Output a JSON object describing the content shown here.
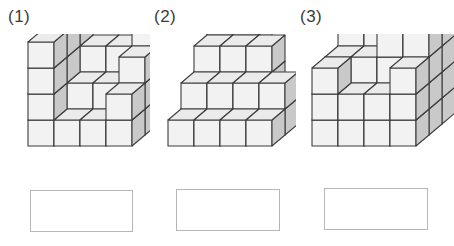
{
  "page": {
    "kind": "math-worksheet-cube-counting",
    "background_color": "#ffffff",
    "width": 454,
    "height": 246
  },
  "cube_style": {
    "top_face_color": "#ebebeb",
    "front_face_color": "#f2f2f2",
    "side_face_color": "#c9c9c9",
    "edge_color": "#3c3c3c",
    "edge_width": 1.1,
    "cube_width": 26,
    "cube_height": 26,
    "depth_x": 13,
    "depth_y": 11
  },
  "figures": [
    {
      "id": "figure-1",
      "label": "(1)",
      "answer_value": "",
      "answer_placeholder": "",
      "origin": {
        "x": 28,
        "y": 112
      },
      "columns": [
        {
          "col": 0,
          "row": 0,
          "height": 4
        },
        {
          "col": 1,
          "row": 0,
          "height": 1
        },
        {
          "col": 2,
          "row": 0,
          "height": 1
        },
        {
          "col": 3,
          "row": 0,
          "height": 2
        },
        {
          "col": 0,
          "row": 1,
          "height": 4
        },
        {
          "col": 1,
          "row": 1,
          "height": 2
        },
        {
          "col": 2,
          "row": 1,
          "height": 2
        },
        {
          "col": 3,
          "row": 1,
          "height": 3
        },
        {
          "col": 0,
          "row": 2,
          "height": 5
        },
        {
          "col": 1,
          "row": 2,
          "height": 3
        },
        {
          "col": 2,
          "row": 2,
          "height": 3
        },
        {
          "col": 3,
          "row": 2,
          "height": 5
        }
      ]
    },
    {
      "id": "figure-2",
      "label": "(2)",
      "answer_value": "",
      "answer_placeholder": "",
      "origin": {
        "x": 22,
        "y": 112
      },
      "columns": [
        {
          "col": 0,
          "row": 0,
          "height": 1
        },
        {
          "col": 1,
          "row": 0,
          "height": 1
        },
        {
          "col": 2,
          "row": 0,
          "height": 1
        },
        {
          "col": 3,
          "row": 0,
          "height": 1
        },
        {
          "col": 0,
          "row": 1,
          "height": 2
        },
        {
          "col": 1,
          "row": 1,
          "height": 2
        },
        {
          "col": 2,
          "row": 1,
          "height": 2
        },
        {
          "col": 3,
          "row": 1,
          "height": 2
        },
        {
          "col": 0,
          "row": 2,
          "height": 3
        },
        {
          "col": 1,
          "row": 2,
          "height": 3
        },
        {
          "col": 2,
          "row": 2,
          "height": 3
        },
        {
          "col": 0,
          "row": 3,
          "height": 4
        },
        {
          "col": 1,
          "row": 3,
          "height": 4
        }
      ]
    },
    {
      "id": "figure-3",
      "label": "(3)",
      "answer_value": "",
      "answer_placeholder": "",
      "origin": {
        "x": 20,
        "y": 112
      },
      "columns": [
        {
          "col": 0,
          "row": 0,
          "height": 3
        },
        {
          "col": 1,
          "row": 0,
          "height": 2
        },
        {
          "col": 2,
          "row": 0,
          "height": 2
        },
        {
          "col": 3,
          "row": 0,
          "height": 3
        },
        {
          "col": 0,
          "row": 1,
          "height": 3
        },
        {
          "col": 1,
          "row": 1,
          "height": 3
        },
        {
          "col": 2,
          "row": 1,
          "height": 4
        },
        {
          "col": 3,
          "row": 1,
          "height": 4
        },
        {
          "col": 0,
          "row": 2,
          "height": 4
        },
        {
          "col": 1,
          "row": 2,
          "height": 5
        },
        {
          "col": 2,
          "row": 2,
          "height": 5
        },
        {
          "col": 3,
          "row": 2,
          "height": 4
        }
      ]
    }
  ]
}
